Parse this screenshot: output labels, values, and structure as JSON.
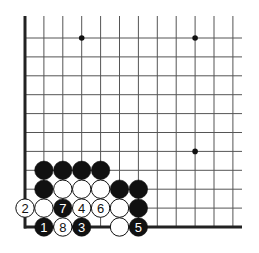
{
  "diagram": {
    "type": "go-board-fragment",
    "region": "lower-left corner",
    "colors": {
      "black": "#111111",
      "white": "#ffffff",
      "line": "#555555",
      "edge": "#222222"
    },
    "grid": {
      "cols": 12,
      "rows": 11,
      "left_edge": true,
      "bottom_edge": true
    },
    "star_points": [
      {
        "col": 3,
        "row": 1
      },
      {
        "col": 9,
        "row": 1
      },
      {
        "col": 9,
        "row": 7
      }
    ],
    "stones": [
      {
        "col": 1,
        "row": 8,
        "color": "black",
        "label": ""
      },
      {
        "col": 2,
        "row": 8,
        "color": "black",
        "label": ""
      },
      {
        "col": 3,
        "row": 8,
        "color": "black",
        "label": ""
      },
      {
        "col": 4,
        "row": 8,
        "color": "black",
        "label": ""
      },
      {
        "col": 1,
        "row": 9,
        "color": "black",
        "label": ""
      },
      {
        "col": 2,
        "row": 9,
        "color": "white",
        "label": ""
      },
      {
        "col": 3,
        "row": 9,
        "color": "white",
        "label": ""
      },
      {
        "col": 4,
        "row": 9,
        "color": "white",
        "label": ""
      },
      {
        "col": 5,
        "row": 9,
        "color": "black",
        "label": ""
      },
      {
        "col": 6,
        "row": 9,
        "color": "black",
        "label": ""
      },
      {
        "col": 0,
        "row": 10,
        "color": "white",
        "label": "2"
      },
      {
        "col": 1,
        "row": 10,
        "color": "white",
        "label": ""
      },
      {
        "col": 2,
        "row": 10,
        "color": "black",
        "label": "7"
      },
      {
        "col": 3,
        "row": 10,
        "color": "white",
        "label": "4"
      },
      {
        "col": 4,
        "row": 10,
        "color": "white",
        "label": "6"
      },
      {
        "col": 5,
        "row": 10,
        "color": "white",
        "label": ""
      },
      {
        "col": 6,
        "row": 10,
        "color": "black",
        "label": ""
      },
      {
        "col": 1,
        "row": 11,
        "color": "black",
        "label": "1"
      },
      {
        "col": 2,
        "row": 11,
        "color": "white",
        "label": "8"
      },
      {
        "col": 3,
        "row": 11,
        "color": "black",
        "label": "3"
      },
      {
        "col": 5,
        "row": 11,
        "color": "white",
        "label": ""
      },
      {
        "col": 6,
        "row": 11,
        "color": "black",
        "label": "5"
      }
    ]
  }
}
